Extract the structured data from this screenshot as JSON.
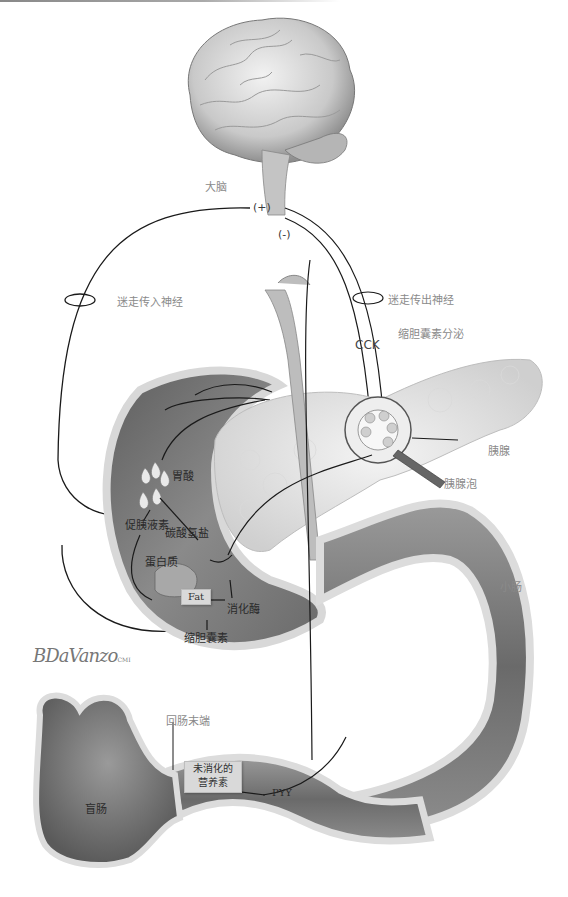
{
  "figure": {
    "type": "anatomical-illustration"
  },
  "labels": {
    "brain": "大脑",
    "plus": "(+)",
    "minus": "(-)",
    "vagal_afferent": "迷走传入神经",
    "vagal_efferent": "迷走传出神经",
    "cck": "CCK",
    "cck_secretion": "缩胆囊素分泌",
    "pancreas": "胰腺",
    "acinus": "胰腺泡",
    "gastric_acid": "胃酸",
    "secretin": "促胰液素",
    "bicarbonate": "碳酸氢盐",
    "protein": "蛋白质",
    "fat": "Fat",
    "digestive_enzymes": "消化酶",
    "cholecystokinin": "缩胆囊素",
    "small_intestine": "小肠",
    "terminal_ileum": "回肠末端",
    "undigested_nutrients_line1": "未消化的",
    "undigested_nutrients_line2": "营养素",
    "pyy": "PYY",
    "cecum": "盲肠"
  },
  "signature": {
    "text": "BDaVanzo",
    "suffix": "CMI"
  },
  "colors": {
    "background": "#ffffff",
    "line": "#1a1a1a",
    "tissue_dark": "#6e6e6e",
    "tissue_mid": "#9a9a9a",
    "tissue_light": "#d6d6d6",
    "label": "#3a3a3a"
  }
}
